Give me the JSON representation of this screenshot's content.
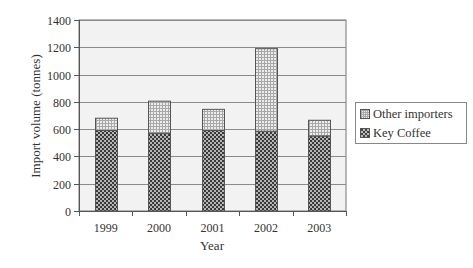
{
  "chart_data": {
    "type": "bar",
    "stacked": true,
    "title": "",
    "xlabel": "Year",
    "ylabel": "Import volume (tonnes)",
    "categories": [
      "1999",
      "2000",
      "2001",
      "2002",
      "2003"
    ],
    "series": [
      {
        "name": "Key Coffee",
        "values": [
          590,
          570,
          590,
          585,
          550
        ],
        "pattern": "dark-checker",
        "color": "#444444"
      },
      {
        "name": "Other importers",
        "values": [
          90,
          235,
          155,
          605,
          115
        ],
        "pattern": "light-grid",
        "color": "#e8e8e8"
      }
    ],
    "totals": [
      680,
      805,
      745,
      1190,
      665
    ],
    "ylim": [
      0,
      1400
    ],
    "yticks": [
      0,
      200,
      400,
      600,
      800,
      1000,
      1200,
      1400
    ],
    "grid": true,
    "legend_position": "right",
    "legend_order": [
      "Other importers",
      "Key Coffee"
    ]
  },
  "legend": {
    "items": [
      {
        "label": "Other importers"
      },
      {
        "label": "Key Coffee"
      }
    ]
  },
  "colors": {
    "plot_background": "#f2f2f2",
    "gridline": "#8a8a8a",
    "axis": "#555555"
  }
}
